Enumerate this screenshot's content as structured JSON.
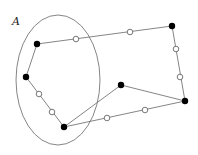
{
  "diagram": {
    "label": "A",
    "label_pos": [
      12,
      25
    ],
    "ellipse": {
      "cx": 58,
      "cy": 80,
      "rx": 42,
      "ry": 65,
      "color": "#777777"
    },
    "line_color": "#777777",
    "nodes": [
      {
        "id": "b1",
        "type": "filled",
        "x": 37,
        "y": 44
      },
      {
        "id": "w1",
        "type": "open",
        "x": 76,
        "y": 39
      },
      {
        "id": "w2",
        "type": "open",
        "x": 130,
        "y": 32
      },
      {
        "id": "b2",
        "type": "filled",
        "x": 172,
        "y": 26
      },
      {
        "id": "w3",
        "type": "open",
        "x": 176,
        "y": 49
      },
      {
        "id": "w4",
        "type": "open",
        "x": 180,
        "y": 77
      },
      {
        "id": "b3",
        "type": "filled",
        "x": 185,
        "y": 101
      },
      {
        "id": "w5",
        "type": "open",
        "x": 145,
        "y": 110
      },
      {
        "id": "w6",
        "type": "open",
        "x": 107,
        "y": 118
      },
      {
        "id": "b4",
        "type": "filled",
        "x": 64,
        "y": 127
      },
      {
        "id": "w7",
        "type": "open",
        "x": 52,
        "y": 112
      },
      {
        "id": "w8",
        "type": "open",
        "x": 39,
        "y": 94
      },
      {
        "id": "b5",
        "type": "filled",
        "x": 26,
        "y": 77
      },
      {
        "id": "b6",
        "type": "filled",
        "x": 121,
        "y": 85
      }
    ],
    "edges": [
      [
        "b1",
        "b2"
      ],
      [
        "b2",
        "b3"
      ],
      [
        "b3",
        "b4"
      ],
      [
        "b4",
        "b5"
      ],
      [
        "b5",
        "b1"
      ],
      [
        "b4",
        "b6"
      ],
      [
        "b6",
        "b3"
      ]
    ]
  }
}
